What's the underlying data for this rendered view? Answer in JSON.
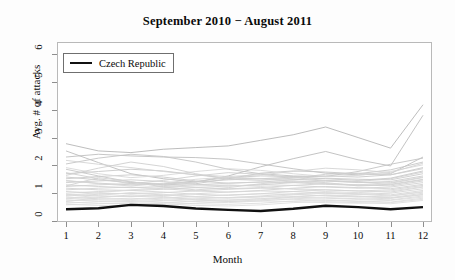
{
  "chart_data": {
    "type": "line",
    "title": "September 2010 − August 2011",
    "xlabel": "Month",
    "ylabel": "Avg. # of attacks",
    "xlim": [
      1,
      12
    ],
    "ylim": [
      0,
      6.4
    ],
    "grid": false,
    "legend": {
      "position": "top-left",
      "entries": [
        {
          "name": "Czech Republic",
          "color": "#111111",
          "width": 2.5
        }
      ]
    },
    "x": [
      1,
      2,
      3,
      4,
      5,
      6,
      7,
      8,
      9,
      10,
      11,
      12
    ],
    "xticklabels": [
      "1",
      "2",
      "3",
      "4",
      "5",
      "6",
      "7",
      "8",
      "9",
      "10",
      "11",
      "12"
    ],
    "yticklabels": [
      "0",
      "1",
      "2",
      "3",
      "4",
      "5",
      "6"
    ],
    "yticks": [
      0,
      1,
      2,
      3,
      4,
      5,
      6
    ],
    "highlight_series": {
      "name": "Czech Republic",
      "color": "#111111",
      "values": [
        0.42,
        0.46,
        0.58,
        0.54,
        0.45,
        0.4,
        0.36,
        0.44,
        0.55,
        0.5,
        0.42,
        0.5
      ]
    },
    "series": [
      {
        "name": "country-01",
        "color": "#b6b6b6",
        "values": [
          2.78,
          2.52,
          2.46,
          2.58,
          2.64,
          2.7,
          2.9,
          3.1,
          3.38,
          3.0,
          2.62,
          4.18
        ]
      },
      {
        "name": "country-02",
        "color": "#bcbcbc",
        "values": [
          2.52,
          2.1,
          1.7,
          1.52,
          1.4,
          1.62,
          1.95,
          2.24,
          2.5,
          2.2,
          1.98,
          3.8
        ]
      },
      {
        "name": "country-03",
        "color": "#c0c0c0",
        "values": [
          2.3,
          2.4,
          2.34,
          2.3,
          2.28,
          2.22,
          2.05,
          1.88,
          1.72,
          1.66,
          1.7,
          2.3
        ]
      },
      {
        "name": "country-04",
        "color": "#c4c4c4",
        "values": [
          2.05,
          2.26,
          2.4,
          2.32,
          2.12,
          1.86,
          1.7,
          1.62,
          1.6,
          1.78,
          2.04,
          2.26
        ]
      },
      {
        "name": "country-05",
        "color": "#c6c6c6",
        "values": [
          1.86,
          1.62,
          1.4,
          1.3,
          1.34,
          1.52,
          1.72,
          1.8,
          1.76,
          1.7,
          1.84,
          2.12
        ]
      },
      {
        "name": "country-06",
        "color": "#c8c8c8",
        "values": [
          1.7,
          1.78,
          1.86,
          1.8,
          1.66,
          1.54,
          1.52,
          1.58,
          1.62,
          1.58,
          1.66,
          1.92
        ]
      },
      {
        "name": "country-07",
        "color": "#cacaca",
        "values": [
          1.58,
          1.48,
          1.38,
          1.34,
          1.42,
          1.56,
          1.62,
          1.6,
          1.52,
          1.46,
          1.54,
          1.8
        ]
      },
      {
        "name": "country-08",
        "color": "#cccccc",
        "values": [
          1.52,
          1.6,
          1.66,
          1.58,
          1.44,
          1.36,
          1.4,
          1.48,
          1.54,
          1.5,
          1.48,
          1.7
        ]
      },
      {
        "name": "country-09",
        "color": "#cdcdcd",
        "values": [
          1.44,
          1.36,
          1.3,
          1.32,
          1.4,
          1.48,
          1.52,
          1.5,
          1.44,
          1.38,
          1.42,
          1.62
        ]
      },
      {
        "name": "country-10",
        "color": "#cfcfcf",
        "values": [
          1.38,
          1.44,
          1.48,
          1.42,
          1.32,
          1.26,
          1.3,
          1.38,
          1.44,
          1.4,
          1.36,
          1.56
        ]
      },
      {
        "name": "country-11",
        "color": "#d0d0d0",
        "values": [
          1.3,
          1.24,
          1.2,
          1.24,
          1.3,
          1.36,
          1.4,
          1.38,
          1.32,
          1.28,
          1.32,
          1.5
        ]
      },
      {
        "name": "country-12",
        "color": "#d1d1d1",
        "values": [
          1.24,
          1.3,
          1.34,
          1.28,
          1.2,
          1.16,
          1.2,
          1.28,
          1.34,
          1.3,
          1.26,
          1.44
        ]
      },
      {
        "name": "country-13",
        "color": "#d2d2d2",
        "values": [
          1.18,
          1.12,
          1.1,
          1.14,
          1.2,
          1.26,
          1.3,
          1.28,
          1.22,
          1.18,
          1.22,
          1.38
        ]
      },
      {
        "name": "country-14",
        "color": "#d3d3d3",
        "values": [
          1.12,
          1.18,
          1.22,
          1.16,
          1.08,
          1.04,
          1.1,
          1.18,
          1.24,
          1.2,
          1.16,
          1.32
        ]
      },
      {
        "name": "country-15",
        "color": "#d4d4d4",
        "values": [
          1.06,
          1.0,
          0.98,
          1.02,
          1.08,
          1.14,
          1.18,
          1.16,
          1.12,
          1.08,
          1.12,
          1.28
        ]
      },
      {
        "name": "country-16",
        "color": "#d5d5d5",
        "values": [
          1.0,
          1.06,
          1.1,
          1.04,
          0.96,
          0.92,
          0.98,
          1.06,
          1.12,
          1.08,
          1.04,
          1.22
        ]
      },
      {
        "name": "country-17",
        "color": "#d6d6d6",
        "values": [
          0.96,
          0.9,
          0.88,
          0.92,
          0.98,
          1.04,
          1.08,
          1.06,
          1.0,
          0.96,
          1.0,
          1.16
        ]
      },
      {
        "name": "country-18",
        "color": "#d7d7d7",
        "values": [
          0.9,
          0.96,
          1.0,
          0.94,
          0.86,
          0.84,
          0.9,
          0.98,
          1.02,
          0.98,
          0.94,
          1.1
        ]
      },
      {
        "name": "country-19",
        "color": "#d8d8d8",
        "values": [
          0.86,
          0.8,
          0.78,
          0.82,
          0.88,
          0.94,
          0.98,
          0.96,
          0.9,
          0.86,
          0.9,
          1.04
        ]
      },
      {
        "name": "country-20",
        "color": "#d9d9d9",
        "values": [
          0.8,
          0.86,
          0.9,
          0.84,
          0.78,
          0.74,
          0.8,
          0.88,
          0.92,
          0.88,
          0.84,
          1.0
        ]
      },
      {
        "name": "country-21",
        "color": "#dadada",
        "values": [
          0.76,
          0.72,
          0.7,
          0.74,
          0.8,
          0.84,
          0.88,
          0.86,
          0.82,
          0.78,
          0.82,
          0.94
        ]
      },
      {
        "name": "country-22",
        "color": "#dbdbdb",
        "values": [
          0.72,
          0.78,
          0.82,
          0.76,
          0.7,
          0.66,
          0.72,
          0.8,
          0.84,
          0.8,
          0.76,
          0.9
        ]
      },
      {
        "name": "country-23",
        "color": "#dcdcdc",
        "values": [
          0.68,
          0.64,
          0.62,
          0.66,
          0.72,
          0.76,
          0.8,
          0.78,
          0.74,
          0.7,
          0.74,
          0.86
        ]
      },
      {
        "name": "country-24",
        "color": "#dddddd",
        "values": [
          0.64,
          0.7,
          0.74,
          0.68,
          0.62,
          0.6,
          0.64,
          0.72,
          0.76,
          0.72,
          0.68,
          0.82
        ]
      },
      {
        "name": "country-25",
        "color": "#dedede",
        "values": [
          0.6,
          0.56,
          0.56,
          0.6,
          0.64,
          0.7,
          0.72,
          0.7,
          0.66,
          0.64,
          0.66,
          0.78
        ]
      },
      {
        "name": "country-26",
        "color": "#dfdfdf",
        "values": [
          0.58,
          0.62,
          0.66,
          0.62,
          0.56,
          0.54,
          0.58,
          0.66,
          0.7,
          0.66,
          0.62,
          0.74
        ]
      },
      {
        "name": "country-27",
        "color": "#d8d8d8",
        "values": [
          1.92,
          1.7,
          1.56,
          1.64,
          1.78,
          1.88,
          1.82,
          1.7,
          1.6,
          1.64,
          1.78,
          2.02
        ]
      },
      {
        "name": "country-28",
        "color": "#d4d4d4",
        "values": [
          2.18,
          2.04,
          1.92,
          1.78,
          1.66,
          1.6,
          1.66,
          1.78,
          1.9,
          1.84,
          1.74,
          2.08
        ]
      },
      {
        "name": "country-29",
        "color": "#cfcfcf",
        "values": [
          1.64,
          1.9,
          2.12,
          1.96,
          1.7,
          1.5,
          1.46,
          1.54,
          1.68,
          1.72,
          1.66,
          1.88
        ]
      },
      {
        "name": "country-30",
        "color": "#dbdbdb",
        "values": [
          0.92,
          1.02,
          1.12,
          1.2,
          1.26,
          1.3,
          1.24,
          1.14,
          1.06,
          1.02,
          1.08,
          1.24
        ]
      },
      {
        "name": "country-31",
        "color": "#d6d6d6",
        "values": [
          1.46,
          1.34,
          1.26,
          1.36,
          1.5,
          1.58,
          1.52,
          1.42,
          1.34,
          1.3,
          1.38,
          1.58
        ]
      },
      {
        "name": "country-32",
        "color": "#dcdcdc",
        "values": [
          0.82,
          0.92,
          1.02,
          0.96,
          0.88,
          0.82,
          0.86,
          0.94,
          1.0,
          0.96,
          0.9,
          1.06
        ]
      },
      {
        "name": "country-33",
        "color": "#d2d2d2",
        "values": [
          1.26,
          1.56,
          1.42,
          1.22,
          1.12,
          1.2,
          1.34,
          1.44,
          1.38,
          1.26,
          1.3,
          1.48
        ]
      },
      {
        "name": "country-34",
        "color": "#dadada",
        "values": [
          0.7,
          0.84,
          0.94,
          0.88,
          0.76,
          0.7,
          0.76,
          0.86,
          0.94,
          0.9,
          0.82,
          0.96
        ]
      },
      {
        "name": "country-35",
        "color": "#d0d0d0",
        "values": [
          1.74,
          1.52,
          1.34,
          1.46,
          1.62,
          1.74,
          1.68,
          1.56,
          1.46,
          1.42,
          1.52,
          1.76
        ]
      }
    ]
  },
  "legend": {
    "label": "Czech Republic"
  }
}
